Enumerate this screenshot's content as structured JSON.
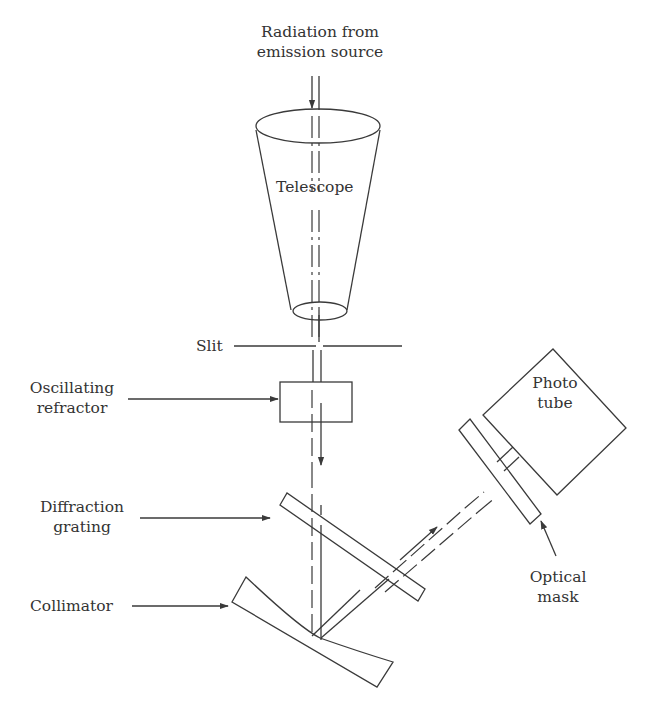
{
  "diagram": {
    "type": "optical-instrument-schematic",
    "line_color": "#3a3a3a",
    "text_color": "#333333",
    "background": "#ffffff",
    "labels": {
      "source": [
        "Radiation from",
        "emission source"
      ],
      "telescope": "Telescope",
      "slit": "Slit",
      "oscillating_refractor": [
        "Oscillating",
        "refractor"
      ],
      "diffraction_grating": [
        "Diffraction",
        "grating"
      ],
      "collimator": "Collimator",
      "photo_tube": [
        "Photo",
        "tube"
      ],
      "optical_mask": [
        "Optical",
        "mask"
      ]
    },
    "components": [
      "telescope",
      "slit",
      "oscillating-refractor",
      "diffraction-grating",
      "collimator",
      "optical-mask",
      "photo-tube"
    ]
  }
}
